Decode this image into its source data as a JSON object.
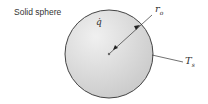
{
  "title": "Solid sphere",
  "labels": {
    "heat_gen": "q̇",
    "radius": "r",
    "radius_sub": "o",
    "surface_temp": "T",
    "surface_temp_sub": "s"
  },
  "colors": {
    "sphere_fill": "#d9d9d9",
    "outline": "#444444"
  }
}
